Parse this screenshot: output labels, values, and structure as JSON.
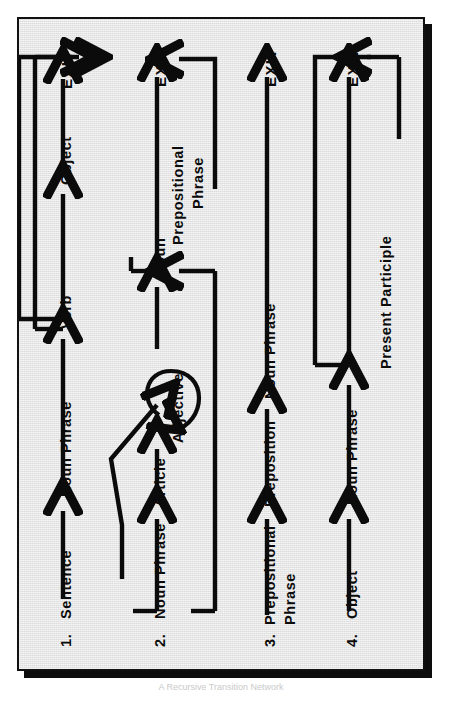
{
  "figure": {
    "orientation": "rotated-90-counterclockwise",
    "background_color": "#dcdcdc",
    "ink_color": "#0b0b0b",
    "frame_border_color": "#111111",
    "shadow_color": "#0d0d0d",
    "caption": "A Recursive Transition Network"
  },
  "exit_label": "EXIT",
  "rows": [
    {
      "number": "1.",
      "name": "Sentence",
      "sequence": [
        "Noun Phrase",
        "Verb",
        "Object"
      ],
      "exit": "EXIT",
      "bypass": {
        "from": "Verb",
        "to": "EXIT",
        "note": "skip Object and go straight to EXIT"
      }
    },
    {
      "number": "2.",
      "name": "Noun Phrase",
      "sequence": [
        "Article",
        "Adjective",
        "Noun"
      ],
      "exit": "EXIT",
      "self_loop": {
        "on": "Adjective",
        "note": "Adjective may repeat"
      },
      "bypass": {
        "from": "Noun Phrase",
        "to": "Adjective",
        "note": "skip Article"
      },
      "feedback": {
        "from": "Noun",
        "to": "Noun",
        "note": "optional Prepositional Phrase returns to Noun"
      },
      "optional_branch": "Prepositional Phrase"
    },
    {
      "number": "3.",
      "name": "Prepositional Phrase",
      "sequence": [
        "Preposition",
        "Noun Phrase"
      ],
      "exit": "EXIT"
    },
    {
      "number": "4.",
      "name": "Object",
      "sequence": [
        "Noun Phrase",
        "Present Participle"
      ],
      "exit": "EXIT",
      "bypass": {
        "from": "Noun Phrase",
        "to": "EXIT",
        "note": "skip Present Participle"
      }
    }
  ],
  "labels": {
    "r1_num": "1.",
    "r1_name": "Sentence",
    "r1_a": "Noun Phrase",
    "r1_b": "Verb",
    "r1_c": "Object",
    "r1_exit": "EXIT",
    "r2_num": "2.",
    "r2_name": "Noun Phrase",
    "r2_a": "Article",
    "r2_b": "Adjective",
    "r2_c": "Noun",
    "r2_d1": "Prepositional",
    "r2_d2": "Phrase",
    "r2_exit": "EXIT",
    "r3_num": "3.",
    "r3_name1": "Prepositional",
    "r3_name2": "Phrase",
    "r3_a": "Preposition",
    "r3_b": "Noun Phrase",
    "r3_exit": "EXIT",
    "r4_num": "4.",
    "r4_name": "Object",
    "r4_a": "Noun Phrase",
    "r4_b": "Present Participle",
    "r4_exit": "EXIT"
  }
}
